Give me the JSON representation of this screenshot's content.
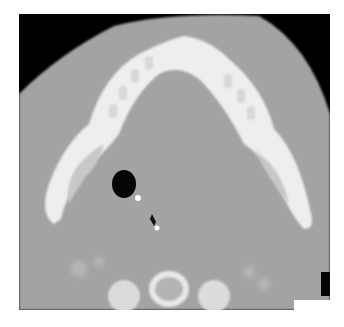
{
  "image": {
    "type": "axial CT scan",
    "description": "Axial CT slice at the level of the mandible showing the mandibular arch with teeth, an air-filled airway lumen with a small bright calcific/metallic focus, and a cervical vertebra posteriorly",
    "colors": {
      "background": "#000000",
      "soft_tissue": "#a4a4a4",
      "bone": "#f2f2f2",
      "air": "#050505",
      "page": "#ffffff"
    }
  }
}
